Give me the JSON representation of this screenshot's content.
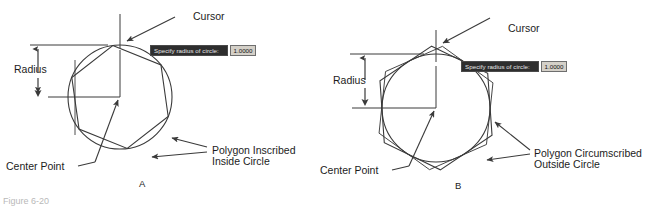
{
  "figure": {
    "caption": "Figure 6-20",
    "panels": [
      {
        "id": "A",
        "letter": "A",
        "command_prompt": {
          "text": "Specify radius of circle:",
          "value": "1.0000"
        },
        "labels": {
          "cursor": "Cursor",
          "radius": "Radius",
          "center_point": "Center Point",
          "polygon_line1": "Polygon Inscribed",
          "polygon_line2": "Inside Circle"
        }
      },
      {
        "id": "B",
        "letter": "B",
        "command_prompt": {
          "text": "Specify radius of circle:",
          "value": "1.0000"
        },
        "labels": {
          "cursor": "Cursor",
          "radius": "Radius",
          "center_point": "Center Point",
          "polygon_line1": "Polygon Circumscribed",
          "polygon_line2": "Outside Circle"
        }
      }
    ]
  },
  "colors": {
    "line": "#3a3a3a",
    "text": "#1c1c1c",
    "prompt_bg": "#2e2e2e",
    "prompt_fg": "#e8e8e8",
    "value_bg": "#d4d0c8",
    "background": "#ffffff"
  }
}
